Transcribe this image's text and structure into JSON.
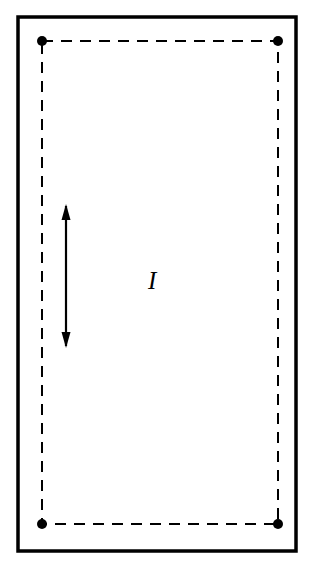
{
  "figure": {
    "background_color": "#ffffff",
    "stroke_color": "#000000",
    "outer_frame": {
      "name": "outer-border-frame",
      "x": 18,
      "y": 17,
      "width": 278,
      "height": 534,
      "stroke_width": 3.5,
      "style": "solid"
    },
    "loop": {
      "name": "dashed-current-loop",
      "x": 42,
      "y": 41,
      "width": 236,
      "height": 483,
      "stroke_width": 2,
      "style": "dashed",
      "dash_pattern": "11 8"
    },
    "corner_nodes": [
      {
        "name": "corner-node-top-left",
        "cx": 42,
        "cy": 41,
        "r": 5
      },
      {
        "name": "corner-node-top-right",
        "cx": 278,
        "cy": 41,
        "r": 5
      },
      {
        "name": "corner-node-bottom-left",
        "cx": 42,
        "cy": 524,
        "r": 5
      },
      {
        "name": "corner-node-bottom-right",
        "cx": 278,
        "cy": 524,
        "r": 5
      }
    ],
    "arrow": {
      "name": "vertical-double-headed-arrow",
      "x": 66,
      "y_top": 204,
      "y_bottom": 348,
      "stroke_width": 2.2,
      "heads": "both",
      "head_width": 9,
      "head_length": 16,
      "orientation": "vertical"
    },
    "labels": [
      {
        "name": "current-label",
        "text": "I",
        "meaning": "current",
        "x": 157,
        "y": 283,
        "font_size": 25,
        "font_style": "italic"
      }
    ]
  }
}
